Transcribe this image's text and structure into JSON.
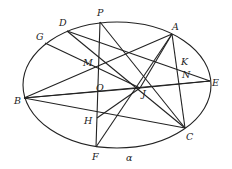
{
  "diagram": {
    "ellipse": {
      "cx": 117,
      "cy": 85,
      "rx": 94,
      "ry": 63,
      "label": "α",
      "label_pos": [
        126,
        161
      ]
    },
    "points": [
      {
        "name": "P",
        "x": 100,
        "y": 22,
        "lx": 97,
        "ly": 16
      },
      {
        "name": "D",
        "x": 67,
        "y": 31,
        "lx": 59,
        "ly": 26
      },
      {
        "name": "G",
        "x": 45,
        "y": 43,
        "lx": 36,
        "ly": 40
      },
      {
        "name": "A",
        "x": 172,
        "y": 34,
        "lx": 172,
        "ly": 30
      },
      {
        "name": "K",
        "x": 179,
        "y": 64,
        "lx": 181,
        "ly": 65
      },
      {
        "name": "N",
        "x": 181,
        "y": 79,
        "lx": 182,
        "ly": 78
      },
      {
        "name": "E",
        "x": 210,
        "y": 81,
        "lx": 212,
        "ly": 86
      },
      {
        "name": "M",
        "x": 98,
        "y": 63,
        "lx": 83,
        "ly": 66
      },
      {
        "name": "O",
        "x": 107,
        "y": 87,
        "lx": 96,
        "ly": 91
      },
      {
        "name": "J",
        "x": 140,
        "y": 88,
        "lx": 142,
        "ly": 97
      },
      {
        "name": "B",
        "x": 24,
        "y": 98,
        "lx": 14,
        "ly": 104
      },
      {
        "name": "H",
        "x": 97,
        "y": 118,
        "lx": 84,
        "ly": 124
      },
      {
        "name": "C",
        "x": 185,
        "y": 128,
        "lx": 186,
        "ly": 140
      },
      {
        "name": "F",
        "x": 96,
        "y": 147,
        "lx": 92,
        "ly": 160
      }
    ],
    "segments": [
      [
        "P",
        "F"
      ],
      [
        "D",
        "C"
      ],
      [
        "P",
        "C"
      ],
      [
        "G",
        "J"
      ],
      [
        "D",
        "E"
      ],
      [
        "A",
        "B"
      ],
      [
        "A",
        "F"
      ],
      [
        "A",
        "C"
      ],
      [
        "B",
        "E"
      ],
      [
        "B",
        "C"
      ],
      [
        "B",
        "J"
      ],
      [
        "H",
        "J"
      ],
      [
        "J",
        "E"
      ],
      [
        "A",
        "J"
      ]
    ]
  }
}
